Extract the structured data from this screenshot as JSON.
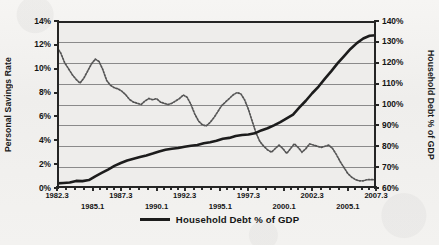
{
  "chart_data": {
    "type": "line",
    "title": "",
    "subtitle": "",
    "xlabel": "",
    "grid": true,
    "legend_position": "bottom-center",
    "axes": {
      "x": {
        "tick_labels": [
          "1982.3",
          "1985.1",
          "1987.3",
          "1990.1",
          "1992.3",
          "1995.1",
          "1997.3",
          "2000.1",
          "2002.3",
          "2005.1",
          "2007.3"
        ],
        "minor_ticks_between": 3,
        "range": [
          1982.3,
          2007.3
        ]
      },
      "y_left": {
        "label": "Personal Savings Rate",
        "tick_labels": [
          "0%",
          "2%",
          "4%",
          "6%",
          "8%",
          "10%",
          "12%",
          "14%"
        ],
        "values": [
          0,
          2,
          4,
          6,
          8,
          10,
          12,
          14
        ],
        "ylim": [
          0,
          14
        ],
        "unit": "%"
      },
      "y_right": {
        "label": "Household Debt % of GDP",
        "tick_labels": [
          "60%",
          "70%",
          "80%",
          "90%",
          "100%",
          "110%",
          "120%",
          "130%",
          "140%"
        ],
        "values": [
          60,
          70,
          80,
          90,
          100,
          110,
          120,
          130,
          140
        ],
        "ylim": [
          60,
          140
        ],
        "unit": "%"
      }
    },
    "legend": [
      {
        "name": "Household Debt % of GDP",
        "style": "solid-thick",
        "color": "#1c1c1c",
        "axis": "y_right"
      }
    ],
    "series": [
      {
        "name": "Household Debt % of GDP",
        "axis": "y_right",
        "style": "solid-thick",
        "color": "#1c1c1c",
        "x": [
          1982.3,
          1982.8,
          1983.3,
          1983.8,
          1984.3,
          1984.8,
          1985.3,
          1985.8,
          1986.3,
          1986.8,
          1987.3,
          1987.8,
          1988.3,
          1988.8,
          1989.3,
          1989.8,
          1990.3,
          1990.8,
          1991.3,
          1991.8,
          1992.3,
          1992.8,
          1993.3,
          1993.8,
          1994.3,
          1994.8,
          1995.3,
          1995.8,
          1996.3,
          1996.8,
          1997.3,
          1997.8,
          1998.3,
          1998.8,
          1999.3,
          1999.8,
          2000.3,
          2000.8,
          2001.3,
          2001.8,
          2002.3,
          2002.8,
          2003.3,
          2003.8,
          2004.3,
          2004.8,
          2005.3,
          2005.8,
          2006.3,
          2006.8,
          2007.3
        ],
        "values": [
          62.2,
          62.4,
          62.6,
          63.4,
          63.3,
          63.8,
          65.6,
          67.2,
          68.8,
          70.6,
          72.0,
          73.2,
          74.0,
          74.8,
          75.6,
          76.5,
          77.5,
          78.3,
          78.8,
          79.2,
          79.8,
          80.2,
          80.6,
          81.4,
          81.9,
          82.6,
          83.6,
          84.0,
          84.9,
          85.4,
          85.6,
          86.2,
          87.6,
          88.6,
          90.0,
          91.6,
          93.4,
          95.2,
          98.6,
          101.8,
          105.4,
          108.6,
          112.4,
          116.0,
          119.8,
          123.2,
          126.6,
          129.4,
          131.6,
          132.9,
          133.2
        ]
      },
      {
        "name": "Personal Savings Rate",
        "axis": "y_left",
        "style": "dotted",
        "color": "#555555",
        "x": [
          1982.3,
          1982.6,
          1982.9,
          1983.2,
          1983.5,
          1983.8,
          1984.1,
          1984.4,
          1984.7,
          1985.0,
          1985.3,
          1985.6,
          1985.9,
          1986.2,
          1986.5,
          1986.8,
          1987.1,
          1987.4,
          1987.7,
          1988.0,
          1988.3,
          1988.6,
          1988.9,
          1989.2,
          1989.5,
          1989.8,
          1990.1,
          1990.4,
          1990.7,
          1991.0,
          1991.3,
          1991.6,
          1991.9,
          1992.2,
          1992.5,
          1992.8,
          1993.1,
          1993.4,
          1993.7,
          1994.0,
          1994.3,
          1994.6,
          1994.9,
          1995.2,
          1995.5,
          1995.8,
          1996.1,
          1996.4,
          1996.7,
          1997.0,
          1997.3,
          1997.6,
          1997.9,
          1998.2,
          1998.5,
          1998.8,
          1999.1,
          1999.4,
          1999.7,
          2000.0,
          2000.3,
          2000.6,
          2000.9,
          2001.2,
          2001.5,
          2001.8,
          2002.1,
          2002.4,
          2002.7,
          2003.0,
          2003.3,
          2003.6,
          2003.9,
          2004.2,
          2004.5,
          2004.8,
          2005.1,
          2005.4,
          2005.7,
          2006.0,
          2006.3,
          2006.6,
          2006.9,
          2007.2,
          2007.3
        ],
        "values": [
          11.8,
          11.3,
          10.5,
          10.0,
          9.5,
          9.1,
          8.8,
          9.2,
          9.8,
          10.4,
          10.8,
          10.6,
          9.9,
          9.0,
          8.6,
          8.4,
          8.3,
          8.1,
          7.8,
          7.4,
          7.2,
          7.1,
          7.0,
          7.3,
          7.5,
          7.4,
          7.5,
          7.2,
          7.1,
          7.0,
          7.1,
          7.3,
          7.5,
          7.8,
          7.6,
          7.0,
          6.2,
          5.6,
          5.3,
          5.2,
          5.5,
          5.9,
          6.4,
          6.9,
          7.2,
          7.5,
          7.8,
          8.0,
          7.9,
          7.4,
          6.6,
          5.6,
          4.6,
          3.9,
          3.5,
          3.2,
          3.0,
          3.3,
          3.6,
          3.3,
          2.9,
          3.3,
          3.7,
          3.4,
          3.0,
          3.3,
          3.7,
          3.6,
          3.5,
          3.4,
          3.5,
          3.6,
          3.3,
          2.8,
          2.2,
          1.7,
          1.2,
          0.9,
          0.7,
          0.6,
          0.6,
          0.7,
          0.7,
          0.7,
          0.7
        ]
      }
    ]
  }
}
